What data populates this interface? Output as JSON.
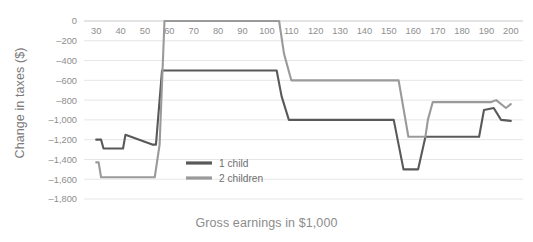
{
  "chart_data": {
    "type": "line",
    "title": "",
    "xlabel": "Gross earnings in $1,000",
    "ylabel": "Change in taxes ($)",
    "xlim": [
      25,
      205
    ],
    "ylim": [
      -1800,
      0
    ],
    "xticks": [
      30,
      40,
      50,
      60,
      70,
      80,
      90,
      100,
      110,
      120,
      130,
      140,
      150,
      160,
      170,
      180,
      190,
      200
    ],
    "yticks": [
      0,
      -200,
      -400,
      -600,
      -800,
      -1000,
      -1200,
      -1400,
      -1600,
      -1800
    ],
    "ytick_labels": [
      "0",
      "–200",
      "–400",
      "–600",
      "–800",
      "–1,000",
      "–1,200",
      "–1,400",
      "–1,600",
      "–1,800"
    ],
    "xtick_labels": [
      "30",
      "40",
      "50",
      "60",
      "70",
      "80",
      "90",
      "100",
      "110",
      "120",
      "130",
      "140",
      "150",
      "160",
      "170",
      "180",
      "190",
      "200"
    ],
    "grid": true,
    "legend_position": "inside-bottom-center",
    "series": [
      {
        "name": "1 child",
        "color": "#595959",
        "x": [
          30,
          32,
          33,
          37,
          38,
          41,
          42,
          53,
          54.5,
          57,
          58,
          104,
          106,
          109,
          150,
          152,
          156,
          162,
          165,
          166,
          169,
          187,
          189,
          193,
          196,
          200
        ],
        "y": [
          -1200,
          -1200,
          -1290,
          -1290,
          -1290,
          -1290,
          -1150,
          -1250,
          -1250,
          -500,
          -500,
          -500,
          -760,
          -1000,
          -1000,
          -1000,
          -1500,
          -1500,
          -1170,
          -1170,
          -1170,
          -1170,
          -900,
          -880,
          -1000,
          -1010
        ]
      },
      {
        "name": "2 children",
        "color": "#9a9a9a",
        "x": [
          30,
          31,
          32,
          53,
          54,
          56,
          58,
          105,
          107,
          110,
          152,
          154,
          158,
          162,
          165,
          166,
          168,
          192,
          194,
          198,
          200
        ],
        "y": [
          -1430,
          -1430,
          -1580,
          -1580,
          -1580,
          -1250,
          0,
          0,
          -330,
          -600,
          -600,
          -600,
          -1170,
          -1170,
          -1170,
          -1000,
          -820,
          -820,
          -800,
          -880,
          -840
        ]
      }
    ]
  },
  "legend": {
    "items": [
      {
        "label": "1 child",
        "color": "#595959"
      },
      {
        "label": "2 children",
        "color": "#9a9a9a"
      }
    ]
  }
}
